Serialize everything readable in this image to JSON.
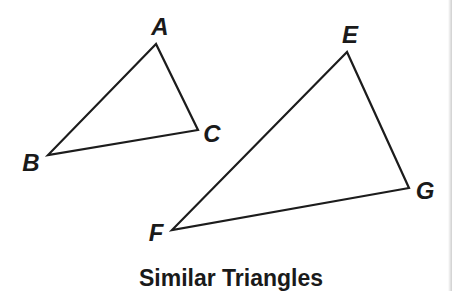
{
  "figure": {
    "caption": "Similar Triangles",
    "colors": {
      "stroke": "#1c1c1c",
      "text": "#1a1a1a",
      "background": "#ffffff"
    },
    "triangles": [
      {
        "name": "ABC",
        "vertices": [
          {
            "label": "A",
            "x": 156,
            "y": 44,
            "label_x": 160,
            "label_y": 26
          },
          {
            "label": "B",
            "x": 48,
            "y": 155,
            "label_x": 31,
            "label_y": 162
          },
          {
            "label": "C",
            "x": 198,
            "y": 130,
            "label_x": 212,
            "label_y": 133
          }
        ]
      },
      {
        "name": "EFG",
        "vertices": [
          {
            "label": "E",
            "x": 347,
            "y": 52,
            "label_x": 350,
            "label_y": 34
          },
          {
            "label": "F",
            "x": 172,
            "y": 230,
            "label_x": 156,
            "label_y": 232
          },
          {
            "label": "G",
            "x": 409,
            "y": 188,
            "label_x": 425,
            "label_y": 190
          }
        ]
      }
    ]
  }
}
